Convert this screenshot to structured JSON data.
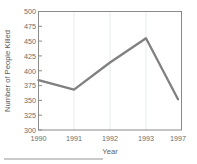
{
  "chart_data": {
    "type": "line",
    "title": "",
    "xlabel": "Year",
    "ylabel": "Number of People Killed",
    "categories": [
      "1990",
      "1991",
      "1992",
      "1993",
      "1997"
    ],
    "values": [
      384,
      368,
      414,
      455,
      352
    ],
    "series": [
      {
        "name": "Number of People Killed",
        "values": [
          384,
          368,
          414,
          455,
          352
        ]
      }
    ],
    "ylim": [
      300,
      500
    ],
    "yticks": [
      300,
      325,
      350,
      375,
      400,
      425,
      450,
      475,
      500
    ],
    "ytick_labels": [
      "300",
      "325",
      "350",
      "375",
      "400",
      "425",
      "450",
      "475",
      "500"
    ],
    "xtick_labels": [
      "1990",
      "1991",
      "1992",
      "1993",
      "1997"
    ],
    "grid": "vertical",
    "legend": "none",
    "line_color": "#808080",
    "axis_color": "#8a8a8a",
    "gridline_color": "#f0f2f6",
    "background_color": "#ffffff",
    "text_color": "#6b6b6b"
  },
  "axes": {
    "y_title": "Number of People Killed",
    "x_title": "Year",
    "y_ticks": [
      {
        "label": "500"
      },
      {
        "label": "475"
      },
      {
        "label": "450"
      },
      {
        "label": "425"
      },
      {
        "label": "400"
      },
      {
        "label": "375"
      },
      {
        "label": "350"
      },
      {
        "label": "325"
      },
      {
        "label": "300"
      }
    ],
    "x_ticks": [
      {
        "label": "1990"
      },
      {
        "label": "1991"
      },
      {
        "label": "1992"
      },
      {
        "label": "1993"
      },
      {
        "label": "1997"
      }
    ]
  }
}
